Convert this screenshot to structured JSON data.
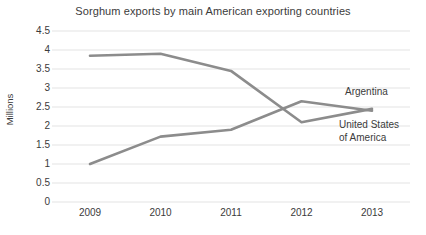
{
  "chart_data": {
    "type": "line",
    "title": "Sorghum exports by main American exporting countries",
    "xlabel": "",
    "ylabel": "Millions",
    "categories": [
      "2009",
      "2010",
      "2011",
      "2012",
      "2013"
    ],
    "x": [
      2009,
      2010,
      2011,
      2012,
      2013
    ],
    "ylim": [
      0,
      4.5
    ],
    "y_ticks": [
      "0",
      "0.5",
      "1",
      "1.5",
      "2",
      "2.5",
      "3",
      "3.5",
      "4",
      "4.5"
    ],
    "y_tick_values": [
      0,
      0.5,
      1,
      1.5,
      2,
      2.5,
      3,
      3.5,
      4,
      4.5
    ],
    "grid": "horizontal",
    "legend_position": "inline-right",
    "series": [
      {
        "name": "United States of America",
        "values": [
          3.85,
          3.9,
          3.45,
          2.1,
          2.45
        ],
        "color": "#8c8c8c"
      },
      {
        "name": "Argentina",
        "values": [
          1.0,
          1.72,
          1.9,
          2.65,
          2.4
        ],
        "color": "#8c8c8c"
      }
    ],
    "annotations": [
      {
        "text": "Argentina",
        "series": "Argentina"
      },
      {
        "text": "United States",
        "series": "United States of America"
      },
      {
        "text": "of America",
        "series": "United States of America"
      }
    ],
    "colors": {
      "line": "#8c8c8c",
      "grid": "#e3e3e3",
      "text": "#3b3b3b",
      "background": "#ffffff"
    }
  },
  "labels": {
    "argentina_line1": "Argentina",
    "usa_line1": "United States",
    "usa_line2": "of America"
  }
}
